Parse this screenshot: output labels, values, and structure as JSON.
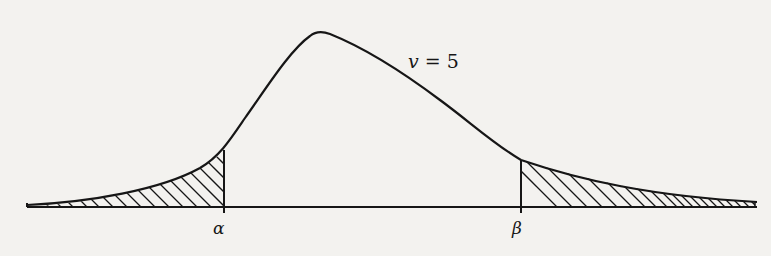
{
  "diagram": {
    "type": "density-curve",
    "curve_label": {
      "symbol": "v",
      "equals": "=",
      "value": "5"
    },
    "markers": [
      {
        "id": "alpha",
        "label": "α"
      },
      {
        "id": "beta",
        "label": "β"
      }
    ],
    "shaded_regions": [
      "left-tail-below-alpha",
      "right-tail-above-beta"
    ],
    "colors": {
      "ink": "#161616",
      "paper": "#f3f2ef"
    }
  }
}
